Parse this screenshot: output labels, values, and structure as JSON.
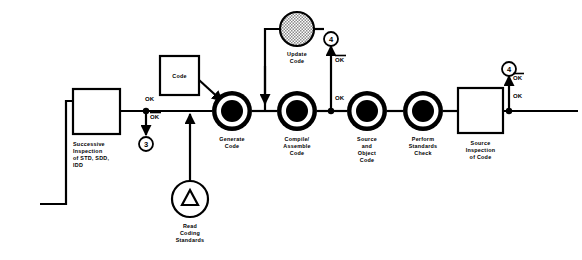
{
  "diagram": {
    "canvas": {
      "width": 582,
      "height": 260,
      "background": "#ffffff"
    },
    "colors": {
      "stroke": "#000000",
      "fill_white": "#ffffff",
      "fill_black": "#000000",
      "fill_hatch": "#b0b0b0"
    },
    "process_nodes": [
      {
        "id": "generate-code",
        "label_lines": [
          "Generate",
          "Code"
        ],
        "shape": "concentric-circles",
        "cx": 232,
        "cy": 111
      },
      {
        "id": "compile-assemble-code",
        "label_lines": [
          "Compile/",
          "Assemble",
          "Code"
        ],
        "shape": "concentric-circles",
        "cx": 297,
        "cy": 111
      },
      {
        "id": "source-and-object-code",
        "label_lines": [
          "Source",
          "and",
          "Object",
          "Code"
        ],
        "shape": "concentric-circles",
        "cx": 367,
        "cy": 111
      },
      {
        "id": "perform-standards-check",
        "label_lines": [
          "Perform",
          "Standards",
          "Check"
        ],
        "shape": "concentric-circles",
        "cx": 423,
        "cy": 111
      }
    ],
    "box_nodes": [
      {
        "id": "successive-inspection",
        "label_lines": [
          "Successive",
          "Inspection",
          "of STD, SDD,",
          "IDD"
        ],
        "x": 73,
        "y": 89,
        "w": 47,
        "h": 45
      },
      {
        "id": "code-box",
        "label_lines": [
          "Code"
        ],
        "x": 160,
        "y": 56,
        "w": 39,
        "h": 39
      },
      {
        "id": "source-inspection-of-code",
        "label_lines": [
          "Source",
          "Inspection",
          "of Code"
        ],
        "x": 458,
        "y": 88,
        "w": 45,
        "h": 45
      }
    ],
    "special_nodes": [
      {
        "id": "update-code",
        "label_lines": [
          "Update",
          "Code"
        ],
        "shape": "hatched-circle",
        "cx": 297,
        "cy": 29,
        "r": 17
      },
      {
        "id": "read-coding-standards",
        "label_lines": [
          "Read",
          "Coding",
          "Standards"
        ],
        "shape": "circle-with-triangle",
        "cx": 190,
        "cy": 199,
        "r": 18
      }
    ],
    "connectors": [
      {
        "id": "connector-3",
        "label": "3",
        "cx": 146,
        "cy": 144,
        "r": 7
      },
      {
        "id": "connector-4-top",
        "label": "4",
        "cx": 331,
        "cy": 39,
        "r": 7
      },
      {
        "id": "connector-4-right",
        "label": "4",
        "cx": 509,
        "cy": 69,
        "r": 7
      }
    ],
    "edge_labels": [
      {
        "id": "ok-successive-right",
        "text": "OK",
        "overbar": false,
        "x": 145,
        "y": 101
      },
      {
        "id": "notok-successive-down",
        "text": "OK",
        "overbar": true,
        "x": 150,
        "y": 119
      },
      {
        "id": "notok-update-branch",
        "text": "OK",
        "overbar": true,
        "x": 335,
        "y": 62
      },
      {
        "id": "ok-compile-right",
        "text": "OK",
        "overbar": false,
        "x": 335,
        "y": 100
      },
      {
        "id": "notok-source-inspection",
        "text": "OK",
        "overbar": true,
        "x": 513,
        "y": 80
      },
      {
        "id": "ok-source-inspection",
        "text": "OK",
        "overbar": false,
        "x": 513,
        "y": 98
      }
    ]
  }
}
